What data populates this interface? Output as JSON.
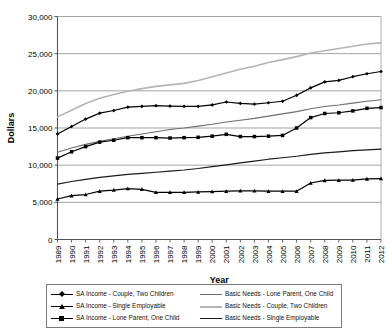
{
  "chart_data": {
    "type": "line",
    "title": "",
    "xlabel": "Year",
    "ylabel": "Dollars",
    "ylim": [
      0,
      30000
    ],
    "yticks": [
      0,
      5000,
      10000,
      15000,
      20000,
      25000,
      30000
    ],
    "ytick_labels": [
      "0",
      "5,000",
      "10,000",
      "15,000",
      "20,000",
      "25,000",
      "30,000"
    ],
    "grid": true,
    "legend_position": "bottom",
    "categories": [
      1989,
      1990,
      1991,
      1992,
      1993,
      1994,
      1995,
      1996,
      1997,
      1998,
      1999,
      2000,
      2001,
      2002,
      2003,
      2004,
      2005,
      2006,
      2007,
      2008,
      2009,
      2010,
      2011,
      2012
    ],
    "xtick_labels": [
      "1989",
      "1990",
      "1991",
      "1992",
      "1993",
      "1994",
      "1995",
      "1996",
      "1997",
      "1998",
      "1999",
      "2000",
      "2001",
      "2002",
      "2003",
      "2004",
      "2005",
      "2006",
      "2007",
      "2008",
      "2009",
      "2010",
      "2011",
      "2012"
    ],
    "series": [
      {
        "name": "SA Income - Couple, Two Children",
        "marker": "diamond",
        "color": "#000000",
        "width": 1.2,
        "values": [
          14200,
          15200,
          16200,
          17000,
          17350,
          17800,
          17900,
          18000,
          17950,
          17900,
          17900,
          18100,
          18500,
          18300,
          18200,
          18400,
          18600,
          19400,
          20400,
          21200,
          21400,
          21900,
          22300,
          22600
        ]
      },
      {
        "name": "SA Income - Single Employable",
        "marker": "triangle",
        "color": "#000000",
        "width": 1.2,
        "values": [
          5450,
          5900,
          6050,
          6500,
          6650,
          6850,
          6750,
          6350,
          6350,
          6350,
          6400,
          6450,
          6500,
          6550,
          6550,
          6500,
          6500,
          6500,
          7600,
          7950,
          7980,
          8000,
          8150,
          8200
        ]
      },
      {
        "name": "SA Income - Lone Parent, One Child",
        "marker": "square",
        "color": "#000000",
        "width": 1.2,
        "values": [
          10950,
          11800,
          12500,
          13100,
          13350,
          13700,
          13700,
          13700,
          13650,
          13700,
          13750,
          13900,
          14150,
          13850,
          13850,
          13900,
          14000,
          15000,
          16400,
          16950,
          17050,
          17300,
          17650,
          17750
        ]
      },
      {
        "name": "Basic Needs - Lone Parent, One Child",
        "marker": "none",
        "color": "#6e6e6e",
        "width": 1.1,
        "values": [
          11750,
          12300,
          12800,
          13200,
          13550,
          13900,
          14200,
          14500,
          14800,
          15000,
          15250,
          15500,
          15800,
          16050,
          16300,
          16600,
          16900,
          17200,
          17600,
          17900,
          18100,
          18350,
          18600,
          18800
        ]
      },
      {
        "name": "Basic Needs - Couple, Two Children",
        "marker": "none",
        "color": "#b4b4b4",
        "width": 1.6,
        "values": [
          16500,
          17400,
          18300,
          19000,
          19500,
          19950,
          20300,
          20600,
          20800,
          21000,
          21400,
          21900,
          22400,
          22900,
          23300,
          23800,
          24200,
          24600,
          25100,
          25400,
          25700,
          26000,
          26300,
          26450
        ]
      },
      {
        "name": "Basic Needs - Single Employable",
        "marker": "none",
        "color": "#1a1a1a",
        "width": 1.2,
        "values": [
          7450,
          7800,
          8100,
          8350,
          8550,
          8750,
          8900,
          9050,
          9200,
          9350,
          9550,
          9800,
          10050,
          10300,
          10550,
          10800,
          11000,
          11200,
          11450,
          11650,
          11800,
          11950,
          12050,
          12150
        ]
      }
    ]
  },
  "legend": {
    "entries": [
      {
        "label": "SA Income - Couple, Two Children",
        "series": 0,
        "column": "left"
      },
      {
        "label": "SA Income - Single Employable",
        "series": 1,
        "column": "left"
      },
      {
        "label": "SA Income - Lone Parent, One Child",
        "series": 2,
        "column": "left"
      },
      {
        "label": "Basic Needs - Lone Parent, One Child",
        "series": 3,
        "column": "right"
      },
      {
        "label": "Basic Needs - Couple, Two Children",
        "series": 4,
        "column": "right"
      },
      {
        "label": "Basic Needs - Single Employable",
        "series": 5,
        "column": "right"
      }
    ]
  }
}
